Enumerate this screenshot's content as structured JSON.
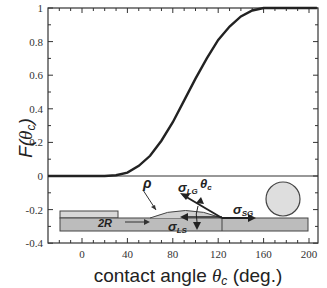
{
  "chart_data": {
    "type": "line",
    "title": "",
    "xlabel": "contact angle θc (deg.)",
    "ylabel": "F(θc)",
    "xlim": [
      -30,
      207
    ],
    "ylim": [
      -0.4,
      1
    ],
    "x_ticks": [
      0,
      40,
      80,
      120,
      160,
      200
    ],
    "y_ticks": [
      -0.4,
      -0.2,
      0,
      0.2,
      0.4,
      0.6,
      0.8,
      1
    ],
    "x_tick_labels": [
      "0",
      "40",
      "80",
      "120",
      "160",
      "200"
    ],
    "y_tick_labels": [
      "-0.4",
      "-0.2",
      "0",
      "0.2",
      "0.4",
      "0.6",
      "0.8",
      "1"
    ],
    "grid": false,
    "legend": null,
    "series": [
      {
        "name": "F(θc)",
        "x": [
          -30,
          0,
          20,
          30,
          40,
          50,
          60,
          70,
          80,
          90,
          100,
          110,
          120,
          130,
          140,
          150,
          160,
          170,
          180,
          207
        ],
        "values": [
          0,
          0,
          0.0,
          0.005,
          0.02,
          0.06,
          0.12,
          0.21,
          0.32,
          0.45,
          0.58,
          0.7,
          0.81,
          0.89,
          0.95,
          0.985,
          1.0,
          1.0,
          1.0,
          1.0
        ]
      }
    ],
    "annotations": [
      "ρ",
      "σLG",
      "θc",
      "σSG",
      "2R",
      "σLS"
    ],
    "inset": "schematic of droplet on substrate below y=0 line"
  },
  "labels": {
    "y_axis": "F(θc)",
    "x_axis": "contact angle θc (deg.)",
    "rho": "ρ",
    "sigma": "σ",
    "lg": "LG",
    "ls": "LS",
    "sg": "SG",
    "theta": "θ",
    "theta_sub": "c",
    "twoR": "2R"
  }
}
